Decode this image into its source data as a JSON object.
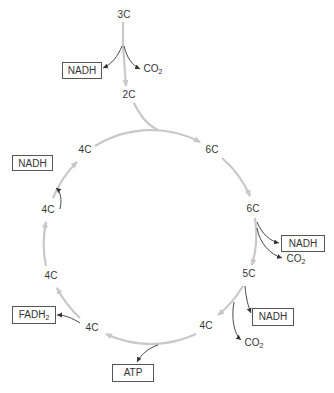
{
  "colors": {
    "cycle_line": "#c8c8c8",
    "side_arrow": "#333333",
    "box_border": "#555555",
    "text": "#333333"
  },
  "entry": {
    "start": "3C",
    "after": "2C"
  },
  "intermediates": {
    "c6a": "6C",
    "c6b": "6C",
    "c5": "5C",
    "c4a": "4C",
    "c4b": "4C",
    "c4c": "4C",
    "c4d": "4C",
    "c4e": "4C"
  },
  "products": {
    "nadh_entry": "NADH",
    "co2_entry": "CO",
    "co2_entry_sub": "2",
    "nadh_6c": "NADH",
    "co2_6c": "CO",
    "co2_6c_sub": "2",
    "nadh_5c": "NADH",
    "co2_5c": "CO",
    "co2_5c_sub": "2",
    "atp": "ATP",
    "fadh": "FADH",
    "fadh_sub": "2",
    "nadh_4c": "NADH"
  }
}
